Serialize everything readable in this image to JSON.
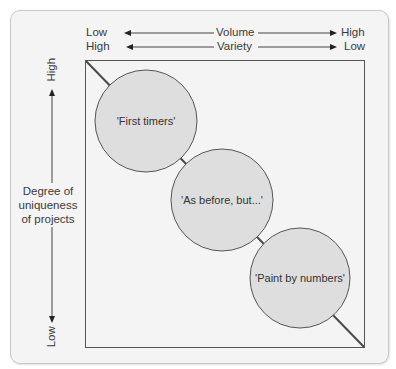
{
  "diagram": {
    "title": "",
    "x_axis": {
      "row1": {
        "left": "Low",
        "center": "Volume",
        "right": "High"
      },
      "row2": {
        "left": "High",
        "center": "Variety",
        "right": "Low"
      }
    },
    "y_axis": {
      "top": "High",
      "bottom": "Low",
      "label_lines": [
        "Degree of",
        "uniqueness",
        "of projects"
      ]
    },
    "nodes": [
      {
        "id": "first-timers",
        "label": "'First timers'",
        "cx": 146,
        "cy": 121,
        "r": 51
      },
      {
        "id": "as-before-but",
        "label": "'As before, but...'",
        "cx": 222,
        "cy": 200,
        "r": 51
      },
      {
        "id": "paint-by-numbers",
        "label": "'Paint by numbers'",
        "cx": 300,
        "cy": 278,
        "r": 50
      }
    ],
    "colors": {
      "panel_bg": "#f4f4f4",
      "circle_fill": "#dedede",
      "line": "#4a4a4a"
    }
  }
}
